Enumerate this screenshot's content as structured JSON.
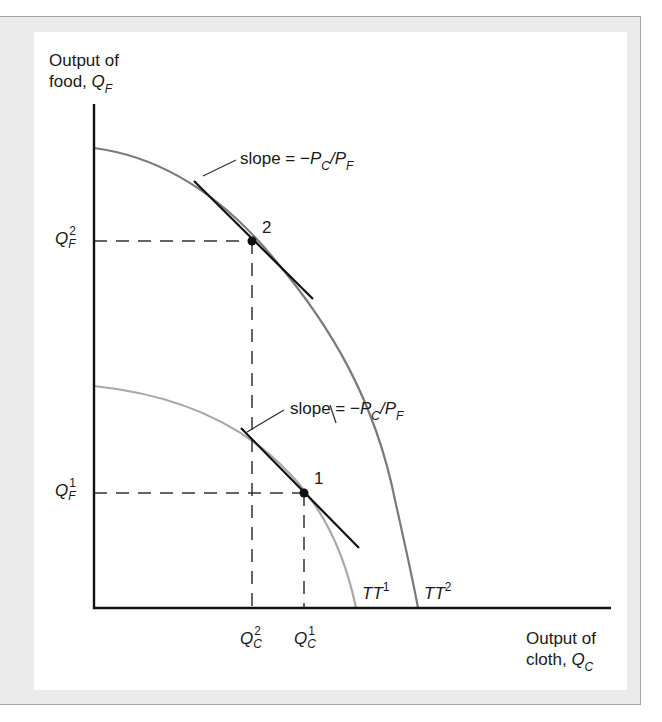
{
  "figure": {
    "y_axis_label_line1": "Output of",
    "y_axis_label_line2": "food,",
    "y_axis_symbol": "Q",
    "y_axis_symbol_sub": "F",
    "x_axis_label_line1": "Output of",
    "x_axis_label_line2": "cloth,",
    "x_axis_symbol": "Q",
    "x_axis_symbol_sub": "C",
    "slope_label_upper": {
      "text": "slope = −",
      "p1": "P",
      "p1_sub": "C",
      "slash": "/",
      "p2": "P",
      "p2_sub": "F"
    },
    "slope_label_lower": {
      "text": "slope = −",
      "p1": "P",
      "p1_sub": "C",
      "slash": "/",
      "p2": "P",
      "p2_sub": "F"
    },
    "point_labels": [
      "1",
      "2"
    ],
    "y_ticks": [
      {
        "symbol": "Q",
        "sup": "2",
        "sub": "F"
      },
      {
        "symbol": "Q",
        "sup": "1",
        "sub": "F"
      }
    ],
    "x_ticks": [
      {
        "symbol": "Q",
        "sup": "2",
        "sub": "C"
      },
      {
        "symbol": "Q",
        "sup": "1",
        "sub": "C"
      }
    ],
    "curve_labels": [
      {
        "name": "TT",
        "sup": "1"
      },
      {
        "name": "TT",
        "sup": "2"
      }
    ],
    "colors": {
      "axis": "#111111",
      "tt2_curve": "#7a7a7a",
      "tt1_curve": "#a8a8a8",
      "tangent": "#111111",
      "dashed": "#333333",
      "frame_bg": "#ebebeb",
      "frame_border": "#a5a5a5"
    }
  }
}
